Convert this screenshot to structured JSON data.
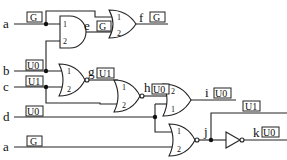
{
  "inputs": {
    "a_top": {
      "name": "a",
      "value": "G"
    },
    "b": {
      "name": "b",
      "value": "U0"
    },
    "c": {
      "name": "c",
      "value": "U1"
    },
    "d": {
      "name": "d",
      "value": "U0"
    },
    "a_bottom": {
      "name": "a",
      "value": "G"
    }
  },
  "nodes": {
    "e": {
      "name": "e",
      "value": "G"
    },
    "f": {
      "name": "f",
      "value": "G"
    },
    "g": {
      "name": "g",
      "value": "U1"
    },
    "h": {
      "name": "h",
      "value": "U0"
    },
    "i": {
      "name": "i",
      "value": "U0"
    },
    "j": {
      "name": "j",
      "value": "U1"
    },
    "k": {
      "name": "k",
      "value": "U0"
    }
  },
  "gates": {
    "and_e": {
      "type": "AND",
      "pins": [
        "1",
        "2"
      ]
    },
    "or_f": {
      "type": "OR",
      "pins": [
        "1",
        "2"
      ]
    },
    "nor_g": {
      "type": "NOR",
      "pins": [
        "1",
        "2"
      ]
    },
    "nor_h": {
      "type": "NOR",
      "pins": [
        "1",
        "2"
      ]
    },
    "or_i": {
      "type": "OR",
      "pins": [
        "2",
        "1"
      ]
    },
    "nor_j": {
      "type": "NOR",
      "pins": [
        "1",
        "2"
      ]
    },
    "not_k": {
      "type": "NOT"
    }
  }
}
